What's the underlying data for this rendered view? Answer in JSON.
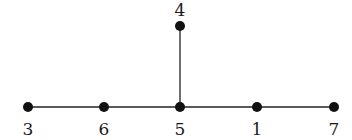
{
  "diagram": {
    "type": "tree",
    "nodes": [
      {
        "id": "3",
        "label": "3",
        "x": 28,
        "y": 107,
        "label_pos": "below"
      },
      {
        "id": "6",
        "label": "6",
        "x": 104,
        "y": 107,
        "label_pos": "below"
      },
      {
        "id": "5",
        "label": "5",
        "x": 180,
        "y": 107,
        "label_pos": "below"
      },
      {
        "id": "1",
        "label": "1",
        "x": 257,
        "y": 107,
        "label_pos": "below"
      },
      {
        "id": "7",
        "label": "7",
        "x": 334,
        "y": 107,
        "label_pos": "below"
      },
      {
        "id": "4",
        "label": "4",
        "x": 180,
        "y": 26,
        "label_pos": "above"
      }
    ],
    "edges": [
      [
        "3",
        "6"
      ],
      [
        "6",
        "5"
      ],
      [
        "5",
        "1"
      ],
      [
        "1",
        "7"
      ],
      [
        "5",
        "4"
      ]
    ],
    "colors": {
      "node": "#111111",
      "edge": "#222222"
    }
  }
}
